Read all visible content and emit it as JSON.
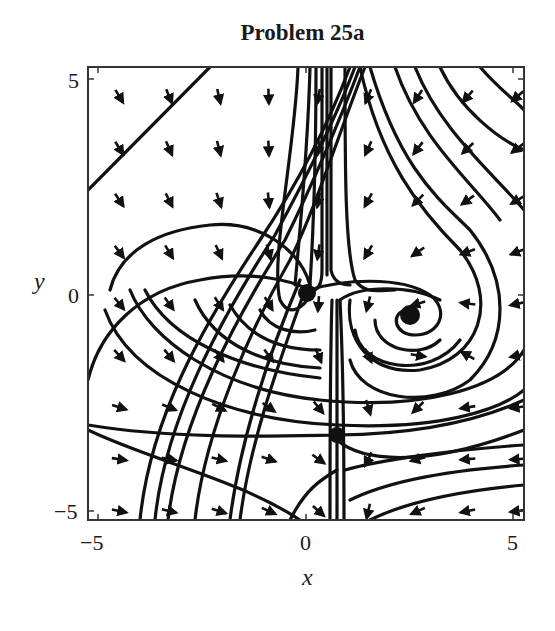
{
  "chart_data": {
    "type": "streamplot",
    "title": "Problem 25a",
    "xlabel": "x",
    "ylabel": "y",
    "xlim": [
      -5,
      5
    ],
    "ylim": [
      -5,
      5
    ],
    "x_ticks": [
      "-5",
      "0",
      "5"
    ],
    "y_ticks": [
      "-5",
      "0",
      "5"
    ],
    "grid": false,
    "legend": null,
    "equilibria": [
      {
        "type": "stable node/sink",
        "x": 0.0,
        "y": 0.0
      },
      {
        "type": "stable spiral",
        "x": 2.5,
        "y": -0.5
      },
      {
        "type": "saddle",
        "x": 0.75,
        "y": -3.25
      }
    ],
    "colors": {
      "stroke": "#111111",
      "frame": "#333333",
      "background": "#ffffff"
    }
  },
  "labels": {
    "title": "Problem 25a",
    "x_tick_neg": "−5",
    "x_tick_zero": "0",
    "x_tick_pos": "5",
    "y_tick_neg": "−5",
    "y_tick_zero": "0",
    "y_tick_pos": "5",
    "xlabel": "x",
    "ylabel": "y"
  }
}
